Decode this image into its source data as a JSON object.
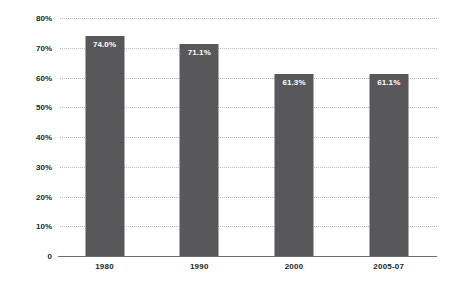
{
  "chart_data": {
    "type": "bar",
    "title": "",
    "subtitle": "",
    "xlabel": "",
    "ylabel": "",
    "categories": [
      "1980",
      "1990",
      "2000",
      "2005-07"
    ],
    "values": [
      74.0,
      71.1,
      61.3,
      61.1
    ],
    "data_labels": [
      "74.0%",
      "71.1%",
      "61.3%",
      "61.1%"
    ],
    "ylim": [
      0,
      80
    ],
    "ytick_values": [
      0,
      10,
      20,
      30,
      40,
      50,
      60,
      70,
      80
    ],
    "ytick_labels": [
      "0",
      "10%",
      "20%",
      "30%",
      "40%",
      "50%",
      "60%",
      "70%",
      "80%"
    ],
    "grid": true,
    "grid_axis": "y",
    "grid_style": "dotted",
    "legend": false,
    "legend_position": "none",
    "series": [
      {
        "name": "",
        "values": [
          74.0,
          71.1,
          61.3,
          61.1
        ]
      }
    ],
    "colors": {
      "bar_fill": "#58585a",
      "data_label_text": "#ffffff",
      "axis_text": "#231f20",
      "axis_line": "#6d6e71",
      "gridline": "#b9b9bb",
      "background": "#ffffff"
    }
  }
}
